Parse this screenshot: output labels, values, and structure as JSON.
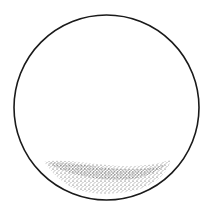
{
  "diagram": {
    "type": "circle-with-sediment",
    "outline": {
      "shape": "circle",
      "cx": 106.5,
      "cy": 107.5,
      "r": 92.5,
      "stroke": "#1a1a1a",
      "stroke_width": 1.6
    },
    "sediment": {
      "shape": "stippled-crescent",
      "color": "#2a2a2a",
      "x_range": [
        44,
        171
      ],
      "y_range": [
        160,
        194
      ]
    },
    "background": "#ffffff"
  }
}
